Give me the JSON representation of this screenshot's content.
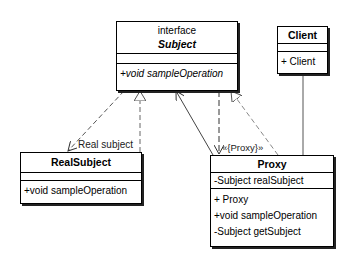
{
  "diagram": {
    "type": "UML class diagram - Proxy pattern",
    "classes": {
      "subject": {
        "stereotype": "interface",
        "name": "Subject",
        "attributes": [],
        "operations": [
          "+void sampleOperation"
        ]
      },
      "client": {
        "name": "Client",
        "attributes": [],
        "operations": [
          "+ Client"
        ]
      },
      "real_subject": {
        "name": "RealSubject",
        "attributes": [],
        "operations": [
          "+void sampleOperation"
        ]
      },
      "proxy": {
        "name": "Proxy",
        "attributes": [
          "-Subject realSubject"
        ],
        "operations": [
          "+ Proxy",
          "+void sampleOperation",
          "-Subject getSubject"
        ]
      }
    },
    "relationships": [
      {
        "from": "RealSubject",
        "to": "Subject",
        "kind": "realization"
      },
      {
        "from": "Subject",
        "to": "RealSubject",
        "kind": "dependency",
        "label": "Real subject"
      },
      {
        "from": "Proxy",
        "to": "Subject",
        "kind": "realization"
      },
      {
        "from": "Proxy",
        "to": "Subject",
        "kind": "association"
      },
      {
        "from": "Subject",
        "to": "Proxy",
        "kind": "dependency",
        "label": "«{Proxy}»"
      },
      {
        "from": "Client",
        "to": "Proxy",
        "kind": "association"
      }
    ],
    "labels": {
      "real_subject_edge": "Real subject",
      "proxy_edge": "«{Proxy}»"
    }
  }
}
